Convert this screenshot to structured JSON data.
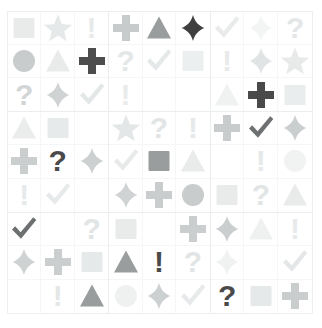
{
  "page": {
    "background_color": "#ffffff",
    "grid_border_color": "#eceff0",
    "block_border_color": "#eaeef0",
    "cell_border_color": "#f4f6f7"
  },
  "legend": {
    "symbols": [
      "square",
      "star",
      "exclamation",
      "circle",
      "triangle",
      "cross",
      "question",
      "diamond",
      "check",
      "blank"
    ],
    "shades": {
      "dark": "#4a4a4a",
      "medium": "#9a9a9a",
      "light": "#cfcfcf",
      "faint": "#e8eaea",
      "ghost": "#f2f4f4"
    }
  },
  "grid": {
    "rows": 9,
    "cols": 9,
    "block_rows": 3,
    "block_cols": 3,
    "blocks": [
      {
        "name": "block-top-left",
        "cells": [
          {
            "symbol": "square",
            "shade": "faint",
            "color": "#e9ebeb"
          },
          {
            "symbol": "star",
            "shade": "faint",
            "color": "#e6e9e9"
          },
          {
            "symbol": "exclamation",
            "shade": "faint",
            "color": "#e8eaea"
          },
          {
            "symbol": "circle",
            "shade": "light",
            "color": "#c9cccc"
          },
          {
            "symbol": "triangle",
            "shade": "faint",
            "color": "#e9ebeb"
          },
          {
            "symbol": "cross",
            "shade": "dark",
            "color": "#4d4d4d"
          },
          {
            "symbol": "question",
            "shade": "light",
            "color": "#d3d6d6"
          },
          {
            "symbol": "diamond",
            "shade": "light",
            "color": "#d0d3d3"
          },
          {
            "symbol": "check",
            "shade": "faint",
            "color": "#e3e7e7"
          }
        ]
      },
      {
        "name": "block-top-center",
        "cells": [
          {
            "symbol": "cross",
            "shade": "light",
            "color": "#c8cbcb"
          },
          {
            "symbol": "triangle",
            "shade": "medium",
            "color": "#9a9d9d"
          },
          {
            "symbol": "diamond",
            "shade": "dark",
            "color": "#3f3f3f"
          },
          {
            "symbol": "question",
            "shade": "faint",
            "color": "#e4e7e7"
          },
          {
            "symbol": "check",
            "shade": "faint",
            "color": "#e6e9e9"
          },
          {
            "symbol": "square",
            "shade": "faint",
            "color": "#ecefef"
          },
          {
            "symbol": "exclamation",
            "shade": "faint",
            "color": "#e9ebeb"
          },
          {
            "symbol": "blank",
            "shade": "none",
            "color": "#ffffff"
          },
          {
            "symbol": "blank",
            "shade": "none",
            "color": "#ffffff"
          }
        ]
      },
      {
        "name": "block-top-right",
        "cells": [
          {
            "symbol": "check",
            "shade": "faint",
            "color": "#e9ebeb"
          },
          {
            "symbol": "diamond",
            "shade": "ghost",
            "color": "#f3f5f5"
          },
          {
            "symbol": "question",
            "shade": "faint",
            "color": "#e4e7e7"
          },
          {
            "symbol": "exclamation",
            "shade": "faint",
            "color": "#e8eaea"
          },
          {
            "symbol": "diamond",
            "shade": "faint",
            "color": "#e1e4e4"
          },
          {
            "symbol": "star",
            "shade": "faint",
            "color": "#e8eaea"
          },
          {
            "symbol": "triangle",
            "shade": "ghost",
            "color": "#f0f2f2"
          },
          {
            "symbol": "cross",
            "shade": "dark",
            "color": "#4a4a4a"
          },
          {
            "symbol": "square",
            "shade": "faint",
            "color": "#eaeded"
          }
        ]
      },
      {
        "name": "block-middle-left",
        "cells": [
          {
            "symbol": "triangle",
            "shade": "faint",
            "color": "#ebeded"
          },
          {
            "symbol": "square",
            "shade": "faint",
            "color": "#e7eaea"
          },
          {
            "symbol": "blank",
            "shade": "none",
            "color": "#ffffff"
          },
          {
            "symbol": "cross",
            "shade": "light",
            "color": "#cbcece"
          },
          {
            "symbol": "question",
            "shade": "dark",
            "color": "#4a4a4a"
          },
          {
            "symbol": "diamond",
            "shade": "light",
            "color": "#cdd0d0"
          },
          {
            "symbol": "exclamation",
            "shade": "faint",
            "color": "#e7eaea"
          },
          {
            "symbol": "check",
            "shade": "faint",
            "color": "#e7eaea"
          },
          {
            "symbol": "blank",
            "shade": "none",
            "color": "#ffffff"
          }
        ]
      },
      {
        "name": "block-middle-center",
        "cells": [
          {
            "symbol": "star",
            "shade": "faint",
            "color": "#e4e7e7"
          },
          {
            "symbol": "question",
            "shade": "faint",
            "color": "#e2e5e5"
          },
          {
            "symbol": "exclamation",
            "shade": "faint",
            "color": "#e6e9e9"
          },
          {
            "symbol": "check",
            "shade": "faint",
            "color": "#e8eaea"
          },
          {
            "symbol": "square",
            "shade": "medium",
            "color": "#9a9d9d"
          },
          {
            "symbol": "triangle",
            "shade": "faint",
            "color": "#e9ebeb"
          },
          {
            "symbol": "diamond",
            "shade": "light",
            "color": "#d0d3d3"
          },
          {
            "symbol": "cross",
            "shade": "light",
            "color": "#cacdcd"
          },
          {
            "symbol": "circle",
            "shade": "light",
            "color": "#c9cccc"
          }
        ]
      },
      {
        "name": "block-middle-right",
        "cells": [
          {
            "symbol": "cross",
            "shade": "light",
            "color": "#c9cccc"
          },
          {
            "symbol": "check",
            "shade": "dark",
            "color": "#6e7171"
          },
          {
            "symbol": "diamond",
            "shade": "light",
            "color": "#cbcece"
          },
          {
            "symbol": "blank",
            "shade": "none",
            "color": "#ffffff"
          },
          {
            "symbol": "exclamation",
            "shade": "faint",
            "color": "#e6e9e9"
          },
          {
            "symbol": "circle",
            "shade": "ghost",
            "color": "#f1f3f3"
          },
          {
            "symbol": "square",
            "shade": "faint",
            "color": "#e9ebeb"
          },
          {
            "symbol": "question",
            "shade": "faint",
            "color": "#e2e5e5"
          },
          {
            "symbol": "triangle",
            "shade": "faint",
            "color": "#e9ebeb"
          }
        ]
      },
      {
        "name": "block-bottom-left",
        "cells": [
          {
            "symbol": "check",
            "shade": "dark",
            "color": "#6d7070"
          },
          {
            "symbol": "blank",
            "shade": "none",
            "color": "#ffffff"
          },
          {
            "symbol": "question",
            "shade": "faint",
            "color": "#e2e5e5"
          },
          {
            "symbol": "diamond",
            "shade": "light",
            "color": "#cfd2d2"
          },
          {
            "symbol": "cross",
            "shade": "light",
            "color": "#cbcece"
          },
          {
            "symbol": "square",
            "shade": "faint",
            "color": "#e6e9e9"
          },
          {
            "symbol": "blank",
            "shade": "none",
            "color": "#ffffff"
          },
          {
            "symbol": "exclamation",
            "shade": "faint",
            "color": "#e4e7e7"
          },
          {
            "symbol": "triangle",
            "shade": "medium",
            "color": "#9a9d9d"
          }
        ]
      },
      {
        "name": "block-bottom-center",
        "cells": [
          {
            "symbol": "square",
            "shade": "faint",
            "color": "#e9ebeb"
          },
          {
            "symbol": "blank",
            "shade": "none",
            "color": "#ffffff"
          },
          {
            "symbol": "cross",
            "shade": "light",
            "color": "#cbcece"
          },
          {
            "symbol": "triangle",
            "shade": "medium",
            "color": "#9a9d9d"
          },
          {
            "symbol": "exclamation",
            "shade": "dark",
            "color": "#4a4a4a"
          },
          {
            "symbol": "question",
            "shade": "faint",
            "color": "#e2e5e5"
          },
          {
            "symbol": "circle",
            "shade": "ghost",
            "color": "#eff1f1"
          },
          {
            "symbol": "diamond",
            "shade": "light",
            "color": "#cdd0d0"
          },
          {
            "symbol": "check",
            "shade": "faint",
            "color": "#e7eaea"
          }
        ]
      },
      {
        "name": "block-bottom-right",
        "cells": [
          {
            "symbol": "diamond",
            "shade": "light",
            "color": "#cbcece"
          },
          {
            "symbol": "triangle",
            "shade": "ghost",
            "color": "#eff1f1"
          },
          {
            "symbol": "exclamation",
            "shade": "faint",
            "color": "#e7eaea"
          },
          {
            "symbol": "diamond",
            "shade": "ghost",
            "color": "#f0f2f2"
          },
          {
            "symbol": "blank",
            "shade": "none",
            "color": "#ffffff"
          },
          {
            "symbol": "check",
            "shade": "faint",
            "color": "#e4e7e7"
          },
          {
            "symbol": "question",
            "shade": "dark",
            "color": "#4a4a4a"
          },
          {
            "symbol": "square",
            "shade": "faint",
            "color": "#e6e9e9"
          },
          {
            "symbol": "cross",
            "shade": "light",
            "color": "#cacdcd"
          }
        ]
      }
    ]
  }
}
